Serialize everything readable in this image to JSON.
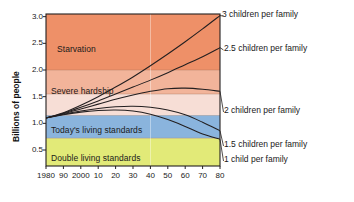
{
  "chart_data": {
    "type": "line",
    "title": "",
    "xlabel": "",
    "ylabel": "Billions of people",
    "xlim": [
      1980,
      2080
    ],
    "ylim": [
      0.2,
      3.05
    ],
    "grid": false,
    "legend_position": "right-inline",
    "x_ticks": [
      {
        "value": 1980,
        "label": "1980"
      },
      {
        "value": 1990,
        "label": "90"
      },
      {
        "value": 2000,
        "label": "2000"
      },
      {
        "value": 2010,
        "label": "10"
      },
      {
        "value": 2020,
        "label": "20"
      },
      {
        "value": 2030,
        "label": "30"
      },
      {
        "value": 2040,
        "label": "40"
      },
      {
        "value": 2050,
        "label": "50"
      },
      {
        "value": 2060,
        "label": "60"
      },
      {
        "value": 2070,
        "label": "70"
      },
      {
        "value": 2080,
        "label": "80"
      }
    ],
    "y_ticks": [
      {
        "value": 0.5,
        "label": "0.5"
      },
      {
        "value": 1.0,
        "label": "1.0"
      },
      {
        "value": 1.5,
        "label": "1.5"
      },
      {
        "value": 2.0,
        "label": "2.0"
      },
      {
        "value": 2.5,
        "label": "2.5"
      },
      {
        "value": 3.0,
        "label": "3.0"
      }
    ],
    "bands": [
      {
        "name": "starvation",
        "label": "Starvation",
        "from": 2.0,
        "to": 3.05,
        "color": "#ee9068"
      },
      {
        "name": "severe-hardship",
        "label": "Severe hardship",
        "from": 1.55,
        "to": 2.0,
        "color": "#f2b49a"
      },
      {
        "name": "middle-band",
        "label": "",
        "from": 1.15,
        "to": 1.55,
        "color": "#f7ded6"
      },
      {
        "name": "todays-standards",
        "label": "Today's living standards",
        "from": 0.72,
        "to": 1.15,
        "color": "#8ab4dd"
      },
      {
        "name": "double-standards",
        "label": "Double living standards",
        "from": 0.2,
        "to": 0.72,
        "color": "#e2ea78"
      }
    ],
    "series": [
      {
        "name": "3-children",
        "label": "3 children per family",
        "x": [
          1980,
          1990,
          2000,
          2010,
          2020,
          2030,
          2040,
          2050,
          2060,
          2070,
          2080
        ],
        "values": [
          1.1,
          1.2,
          1.34,
          1.5,
          1.68,
          1.87,
          2.08,
          2.3,
          2.53,
          2.77,
          3.02
        ]
      },
      {
        "name": "2.5-children",
        "label": "2.5 children per family",
        "x": [
          1980,
          1990,
          2000,
          2010,
          2020,
          2030,
          2040,
          2050,
          2060,
          2070,
          2080
        ],
        "values": [
          1.1,
          1.19,
          1.3,
          1.42,
          1.55,
          1.68,
          1.81,
          1.95,
          2.1,
          2.25,
          2.42
        ]
      },
      {
        "name": "2-children",
        "label": "2 children per family",
        "x": [
          1980,
          1990,
          2000,
          2010,
          2020,
          2030,
          2040,
          2050,
          2060,
          2070,
          2080
        ],
        "values": [
          1.1,
          1.18,
          1.27,
          1.36,
          1.45,
          1.53,
          1.6,
          1.65,
          1.66,
          1.64,
          1.6
        ]
      },
      {
        "name": "1.5-children",
        "label": "1.5 children per family",
        "x": [
          1980,
          1990,
          2000,
          2010,
          2020,
          2030,
          2040,
          2050,
          2060,
          2070,
          2080
        ],
        "values": [
          1.1,
          1.17,
          1.23,
          1.28,
          1.31,
          1.32,
          1.3,
          1.25,
          1.16,
          1.02,
          0.86
        ]
      },
      {
        "name": "1-child",
        "label": "1 child per family",
        "x": [
          1980,
          1990,
          2000,
          2010,
          2020,
          2030,
          2040,
          2050,
          2060,
          2070,
          2080
        ],
        "values": [
          1.1,
          1.16,
          1.21,
          1.24,
          1.25,
          1.23,
          1.17,
          1.07,
          0.94,
          0.8,
          0.7
        ]
      }
    ],
    "vertical_marker_year": 2040,
    "colors": {
      "line": "#231f20",
      "axis": "#231f20",
      "background": "#ffffff",
      "text": "#1a1a1a"
    }
  }
}
